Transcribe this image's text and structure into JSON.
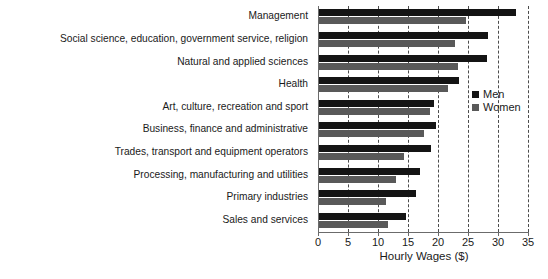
{
  "chart_data": {
    "type": "bar",
    "orientation": "horizontal",
    "title": "",
    "xlabel": "Hourly Wages ($)",
    "ylabel": "",
    "xlim": [
      0,
      35
    ],
    "xticks": [
      0,
      5,
      10,
      15,
      20,
      25,
      30,
      35
    ],
    "grid": "vertical-dashed",
    "legend_position": "inside-right",
    "categories": [
      "Management",
      "Social science, education, government service, religion",
      "Natural and applied sciences",
      "Health",
      "Art, culture, recreation and sport",
      "Business, finance and administrative",
      "Trades, transport and equipment operators",
      "Processing, manufacturing and utilities",
      "Primary industries",
      "Sales and services"
    ],
    "series": [
      {
        "name": "Men",
        "color": "#141414",
        "values": [
          33.0,
          28.3,
          28.2,
          23.5,
          19.3,
          19.7,
          18.8,
          17.0,
          16.3,
          14.7
        ]
      },
      {
        "name": "Women",
        "color": "#595959",
        "values": [
          24.7,
          22.8,
          23.3,
          21.7,
          18.7,
          17.7,
          14.3,
          13.0,
          11.3,
          11.7
        ]
      }
    ]
  },
  "legend": {
    "items": [
      {
        "label": "Men",
        "color": "#141414"
      },
      {
        "label": "Women",
        "color": "#595959"
      }
    ]
  },
  "axis": {
    "x_title": "Hourly Wages ($)",
    "tick_labels": [
      "0",
      "5",
      "10",
      "15",
      "20",
      "25",
      "30",
      "35"
    ]
  }
}
